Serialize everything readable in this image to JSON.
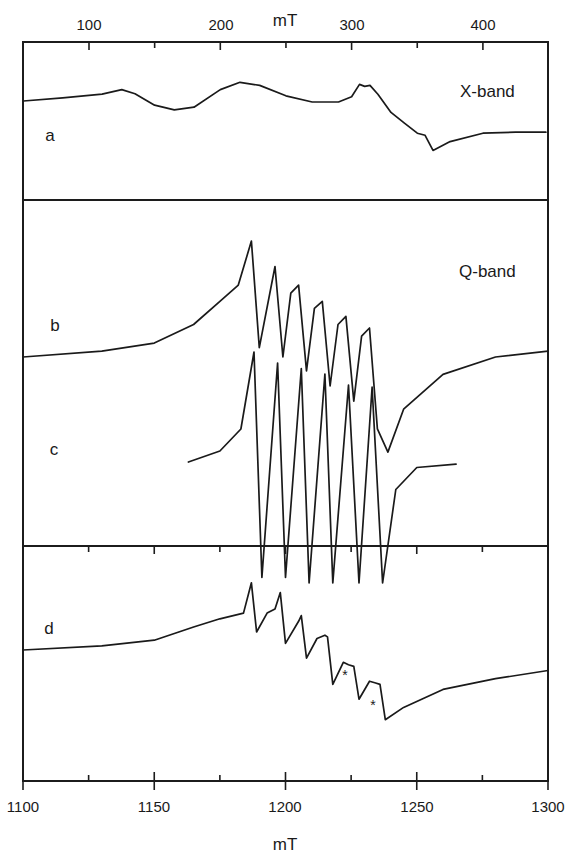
{
  "figure": {
    "top_axis": {
      "title": "mT",
      "ticks_major": [
        100,
        200,
        300,
        400
      ],
      "ticks_minor": [
        50,
        150,
        250,
        350
      ],
      "tick_labels": [
        "100",
        "200",
        "300",
        "400"
      ]
    },
    "bottom_axis": {
      "title": "mT",
      "ticks_major": [
        1100,
        1150,
        1200,
        1250,
        1300
      ],
      "ticks_minor": [
        1125,
        1175,
        1225,
        1275
      ],
      "tick_labels": [
        "1100",
        "1150",
        "1200",
        "1250",
        "1300"
      ]
    },
    "panels": {
      "x_band": {
        "label": "X-band"
      },
      "q_band": {
        "label": "Q-band"
      }
    },
    "trace_labels": {
      "a": "a",
      "b": "b",
      "c": "c",
      "d": "d"
    },
    "asterisk": "*"
  },
  "chart_data": [
    {
      "type": "line",
      "title": "X-band",
      "panel": "top",
      "xlabel": "mT",
      "ylabel": "",
      "xlim": [
        50,
        448
      ],
      "grid": false,
      "legend": "none",
      "series": [
        {
          "name": "a",
          "description": "X-band EPR derivative spectrum, broad features at ~125 mT and ~215 mT, sharp structured feature at ~305-315 mT, minimum at ~360 mT",
          "x": [
            50,
            80,
            110,
            125,
            135,
            150,
            165,
            180,
            200,
            215,
            230,
            250,
            270,
            290,
            300,
            306,
            310,
            314,
            320,
            330,
            340,
            350,
            356,
            362,
            375,
            400,
            425,
            448
          ],
          "y": [
            0.0,
            0.06,
            0.13,
            0.22,
            0.14,
            -0.08,
            -0.17,
            -0.12,
            0.22,
            0.36,
            0.3,
            0.1,
            -0.02,
            -0.02,
            0.08,
            0.32,
            0.28,
            0.3,
            0.13,
            -0.22,
            -0.42,
            -0.62,
            -0.66,
            -0.95,
            -0.78,
            -0.62,
            -0.6,
            -0.6
          ]
        }
      ],
      "annotations": [
        "a",
        "X-band"
      ]
    },
    {
      "type": "line",
      "title": "Q-band",
      "panel": "middle",
      "xlabel": "mT",
      "ylabel": "",
      "xlim": [
        1100,
        1300
      ],
      "grid": false,
      "legend": "none",
      "series": [
        {
          "name": "b",
          "description": "Q-band experimental spectrum with six-line hyperfine pattern",
          "x": [
            1100,
            1130,
            1150,
            1165,
            1175,
            1182,
            1187,
            1190,
            1196,
            1199,
            1202,
            1205,
            1208,
            1211,
            1214,
            1217,
            1220,
            1223,
            1226,
            1229,
            1232,
            1235,
            1239,
            1245,
            1260,
            1280,
            1300
          ],
          "y": [
            0.0,
            0.05,
            0.12,
            0.28,
            0.48,
            0.62,
            1.0,
            0.08,
            0.78,
            0.0,
            0.55,
            0.62,
            -0.12,
            0.42,
            0.48,
            -0.25,
            0.28,
            0.35,
            -0.38,
            0.18,
            0.25,
            -0.62,
            -0.82,
            -0.45,
            -0.15,
            0.0,
            0.05
          ]
        },
        {
          "name": "c",
          "description": "Simulated Q-band spectrum, six sharp hyperfine lines",
          "x": [
            1163,
            1175,
            1183,
            1188,
            1191,
            1197,
            1200,
            1206,
            1209,
            1215,
            1218,
            1224,
            1228,
            1233,
            1237,
            1242,
            1250,
            1265
          ],
          "y": [
            0.0,
            0.1,
            0.3,
            1.0,
            -1.05,
            0.9,
            -1.05,
            0.85,
            -1.1,
            0.8,
            -1.1,
            0.7,
            -1.1,
            0.68,
            -1.1,
            -0.25,
            -0.05,
            -0.02
          ]
        }
      ],
      "line_positions_mT": [
        1188,
        1197,
        1206,
        1215,
        1224,
        1233
      ],
      "annotations": [
        "b",
        "c",
        "Q-band"
      ]
    },
    {
      "type": "line",
      "title": "",
      "panel": "bottom",
      "xlabel": "mT",
      "ylabel": "",
      "xlim": [
        1100,
        1300
      ],
      "grid": false,
      "legend": "none",
      "series": [
        {
          "name": "d",
          "description": "Q-band spectrum with step-like hyperfine pattern; asterisks mark features near 1224 mT and 1234 mT",
          "x": [
            1100,
            1130,
            1150,
            1165,
            1175,
            1184,
            1187,
            1189,
            1193,
            1196,
            1198,
            1200,
            1205,
            1206,
            1208,
            1212,
            1215,
            1216,
            1218,
            1222,
            1224,
            1226,
            1228,
            1232,
            1234,
            1236,
            1238,
            1245,
            1260,
            1280,
            1300
          ],
          "y": [
            0.0,
            0.05,
            0.12,
            0.28,
            0.38,
            0.45,
            0.82,
            0.22,
            0.45,
            0.5,
            0.7,
            0.08,
            0.35,
            0.42,
            -0.1,
            0.14,
            0.18,
            0.16,
            -0.42,
            -0.15,
            -0.18,
            -0.2,
            -0.6,
            -0.38,
            -0.4,
            -0.42,
            -0.85,
            -0.7,
            -0.48,
            -0.35,
            -0.25
          ]
        }
      ],
      "asterisk_positions_mT": [
        1224,
        1234
      ],
      "annotations": [
        "d",
        "*",
        "*"
      ]
    }
  ]
}
